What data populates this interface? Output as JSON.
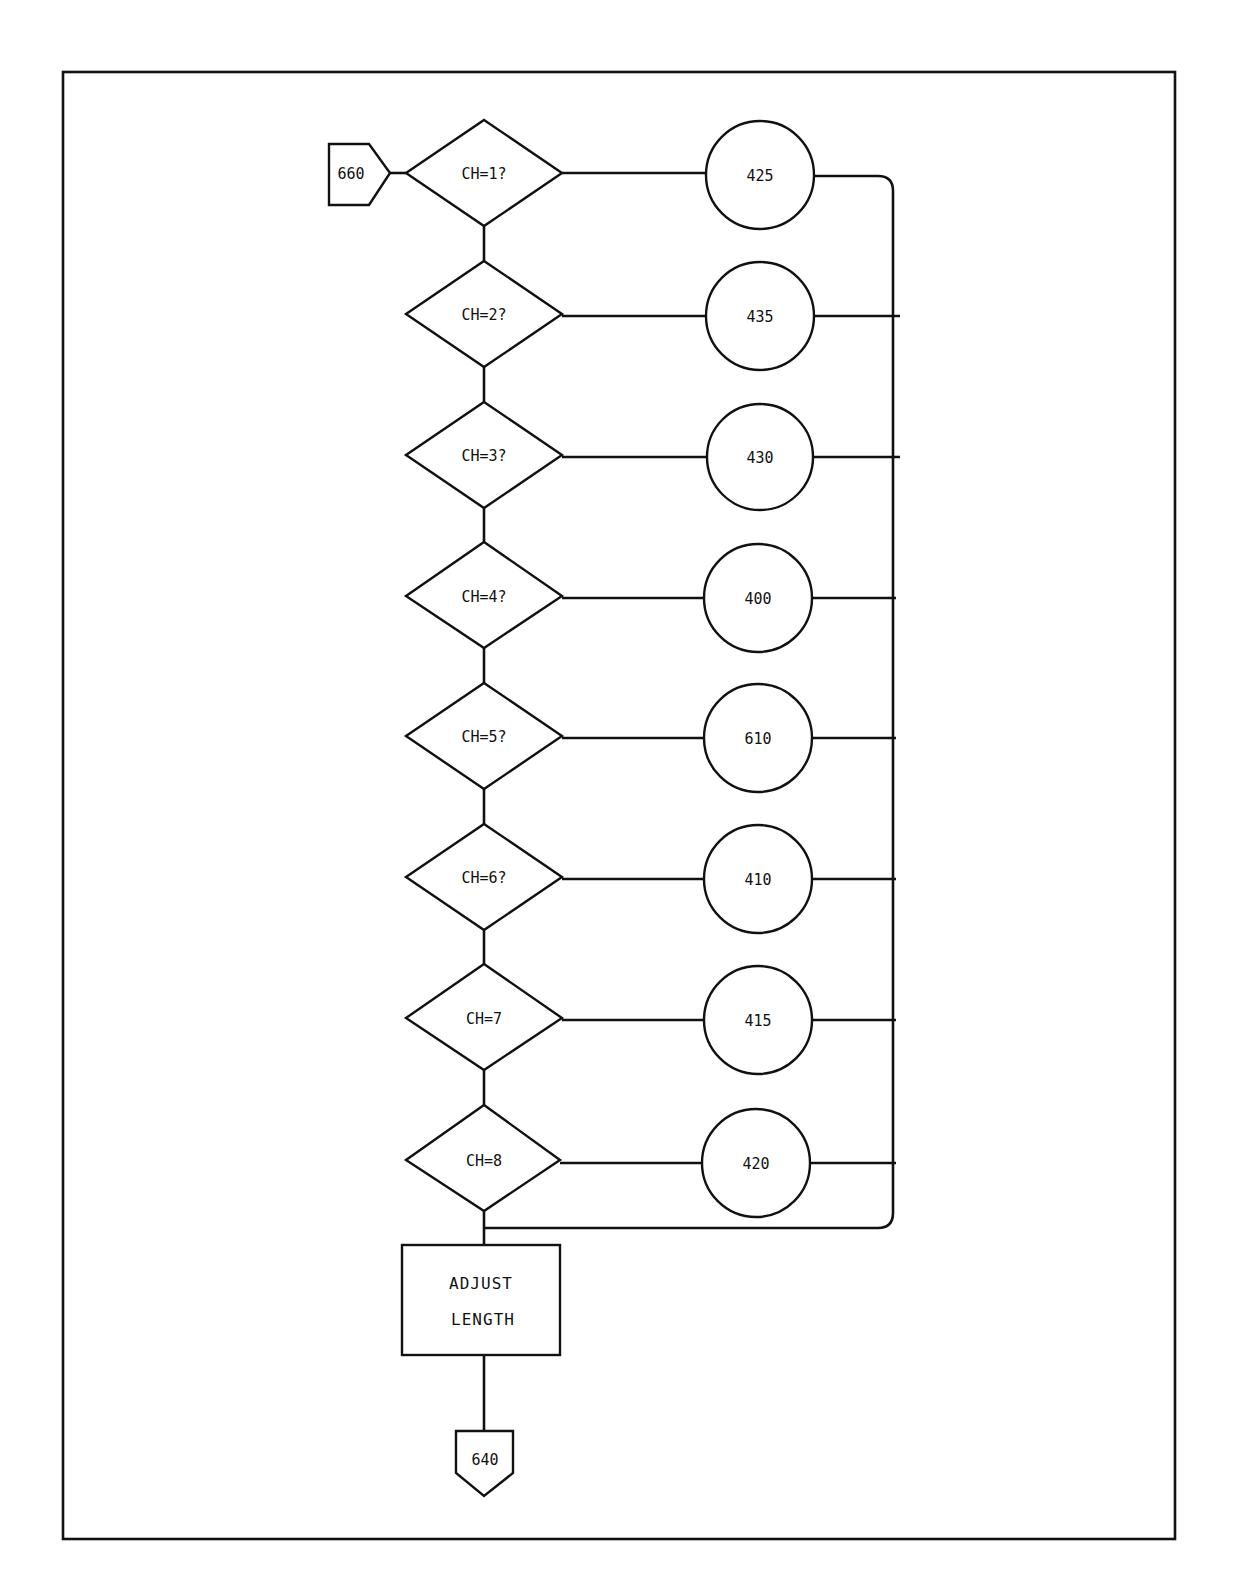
{
  "diagram": {
    "type": "flowchart",
    "entry_connector": {
      "label": "660",
      "shape": "offpage-connector-left"
    },
    "exit_connector": {
      "label": "640",
      "shape": "offpage-connector-down"
    },
    "decisions": [
      {
        "label": "CH=1?",
        "target": "425"
      },
      {
        "label": "CH=2?",
        "target": "435"
      },
      {
        "label": "CH=3?",
        "target": "430"
      },
      {
        "label": "CH=4?",
        "target": "400"
      },
      {
        "label": "CH=5?",
        "target": "610"
      },
      {
        "label": "CH=6?",
        "target": "410"
      },
      {
        "label": "CH=7",
        "target": "415"
      },
      {
        "label": "CH=8",
        "target": "420"
      }
    ],
    "process_box": {
      "line1": "ADJUST",
      "line2": "LENGTH"
    },
    "colors": {
      "stroke": "#111111",
      "background": "#ffffff"
    }
  }
}
